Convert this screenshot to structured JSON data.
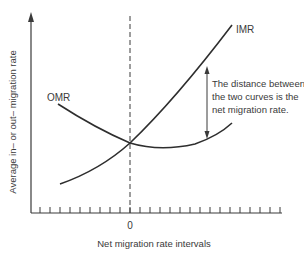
{
  "chart_data": {
    "type": "line",
    "title": "",
    "xlabel": "Net migration rate intervals",
    "ylabel": "Average in– or out– migration rate",
    "x_tick_labels": [
      {
        "position": 0,
        "label": "0"
      }
    ],
    "grid": false,
    "legend": "none (curves labeled directly)",
    "series": [
      {
        "name": "IMR",
        "description": "In-migration rate; convex, rising from left to right",
        "points_relative": [
          [
            -7,
            0.15
          ],
          [
            0,
            0.36
          ],
          [
            3,
            0.5
          ],
          [
            6,
            0.72
          ],
          [
            10,
            0.94
          ]
        ]
      },
      {
        "name": "OMR",
        "description": "Out-migration rate; U-shaped, falling then rising",
        "points_relative": [
          [
            -7,
            0.56
          ],
          [
            0,
            0.36
          ],
          [
            3,
            0.34
          ],
          [
            6,
            0.37
          ],
          [
            10,
            0.46
          ]
        ]
      }
    ],
    "annotations": [
      {
        "type": "reference_line",
        "orientation": "vertical",
        "style": "dashed",
        "at": 0
      },
      {
        "type": "double_arrow",
        "between": [
          "IMR",
          "OMR"
        ],
        "at_x": 7.7,
        "text": "The distance between the two curves is the net migration rate."
      }
    ]
  },
  "labels": {
    "imr": "IMR",
    "omr": "OMR",
    "zero": "0",
    "x_axis": "Net migration rate intervals",
    "y_axis": "Average in– or out– migration rate",
    "annotation_lines": [
      "The distance between",
      "the two curves is the",
      "net migration rate."
    ]
  },
  "colors": {
    "ink": "#3a3a3a",
    "background": "#ffffff"
  }
}
